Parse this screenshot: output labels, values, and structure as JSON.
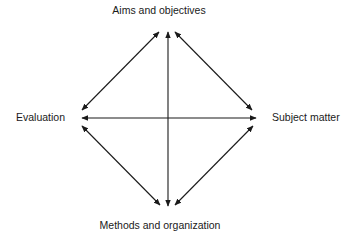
{
  "diagram": {
    "type": "curriculum-relationship-diamond",
    "nodes": {
      "top": "Aims and objectives",
      "left": "Evaluation",
      "right": "Subject matter",
      "bottom": "Methods and organization"
    },
    "edges": [
      {
        "from": "Aims and objectives",
        "to": "Evaluation",
        "style": "double-arrow"
      },
      {
        "from": "Aims and objectives",
        "to": "Subject matter",
        "style": "double-arrow"
      },
      {
        "from": "Evaluation",
        "to": "Methods and organization",
        "style": "double-arrow"
      },
      {
        "from": "Subject matter",
        "to": "Methods and organization",
        "style": "double-arrow"
      },
      {
        "from": "Aims and objectives",
        "to": "Methods and organization",
        "style": "double-arrow"
      },
      {
        "from": "Evaluation",
        "to": "Subject matter",
        "style": "double-arrow"
      }
    ],
    "colors": {
      "line": "#1a1a1a",
      "background": "#ffffff"
    }
  }
}
